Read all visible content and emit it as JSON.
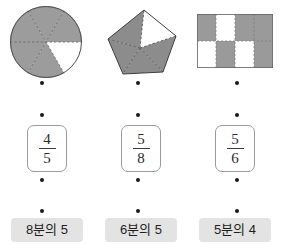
{
  "worksheet": {
    "type": "fraction-matching-exercise",
    "columns": 3,
    "rows": [
      "shapes",
      "fractions",
      "korean-labels"
    ],
    "accent_shade": "#8f8f8f",
    "label_background": "#e3e3e3",
    "dot_color": "#1a1a1a"
  },
  "shapes": [
    {
      "name": "circle",
      "icon": "circle-sectors-shape",
      "total_parts": 6,
      "shaded_parts": 5,
      "fraction_text": "5/6",
      "fill": "#999999",
      "stroke": "#555555"
    },
    {
      "name": "pentagon",
      "icon": "pentagon-triangles-shape",
      "total_parts": 5,
      "shaded_parts": 4,
      "fraction_text": "4/5",
      "fill": "#8c8c8c",
      "stroke": "#4f4f4f"
    },
    {
      "name": "rectangle-grid",
      "icon": "grid-cells-shape",
      "total_parts": 8,
      "shaded_parts": 5,
      "fraction_text": "5/8",
      "fill": "#9a9a9a",
      "stroke": "#707070",
      "grid": {
        "cols": 4,
        "rows": 2,
        "cells": [
          [
            1,
            0,
            1,
            1
          ],
          [
            0,
            1,
            0,
            1
          ]
        ]
      }
    }
  ],
  "fractions": [
    {
      "numerator": "4",
      "denominator": "5"
    },
    {
      "numerator": "5",
      "denominator": "8"
    },
    {
      "numerator": "5",
      "denominator": "6"
    }
  ],
  "labels": [
    {
      "text": "8분의 5"
    },
    {
      "text": "6분의 5"
    },
    {
      "text": "5분의 4"
    }
  ],
  "dots": {
    "row1_y": 83,
    "row2_y": 115,
    "row3_y": 180,
    "row4_y": 211,
    "xs": [
      42,
      138,
      237
    ]
  }
}
